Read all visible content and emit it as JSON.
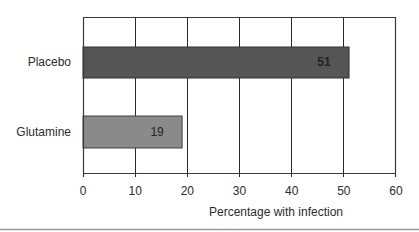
{
  "chart_data": {
    "type": "bar",
    "orientation": "horizontal",
    "title": "",
    "categories": [
      "Placebo",
      "Glutamine"
    ],
    "values": [
      51,
      19
    ],
    "data_labels": [
      "51",
      "19"
    ],
    "bar_colors": [
      "#555555",
      "#8a8a8a"
    ],
    "xlabel": "Percentage with infection",
    "ylabel": "",
    "xlim": [
      0,
      60
    ],
    "x_ticks": [
      "0",
      "10",
      "20",
      "30",
      "40",
      "50",
      "60"
    ],
    "grid": "vertical lines at every 10",
    "legend": null
  },
  "labels": {
    "placebo": "Placebo",
    "glutamine": "Glutamine",
    "placebo_value": "51",
    "glutamine_value": "19",
    "xlabel": "Percentage with infection",
    "ticks": [
      "0",
      "10",
      "20",
      "30",
      "40",
      "50",
      "60"
    ]
  }
}
